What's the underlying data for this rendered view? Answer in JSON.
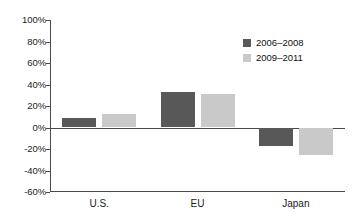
{
  "chart_data": {
    "type": "bar",
    "title": "",
    "subtitle": "",
    "xlabel": "",
    "ylabel": "",
    "categories": [
      "U.S.",
      "EU",
      "Japan"
    ],
    "series": [
      {
        "name": "2006–2008",
        "color": "#585858",
        "values": [
          9,
          33,
          -17
        ]
      },
      {
        "name": "2009–2011",
        "color": "#c9c9c9",
        "values": [
          13,
          31,
          -26
        ]
      }
    ],
    "ylim": [
      -60,
      100
    ],
    "ytick_step": 20,
    "ytick_labels": [
      "100%",
      "80%",
      "60%",
      "40%",
      "20%",
      "0%",
      "-20%",
      "-40%",
      "-60%"
    ],
    "ytick_values": [
      100,
      80,
      60,
      40,
      20,
      0,
      -20,
      -40,
      -60
    ],
    "grid": false,
    "legend_position": "top-right-inside",
    "zero_line": true,
    "value_format": "percent"
  },
  "axes": {
    "y_labels": [
      "100%",
      "80%",
      "60%",
      "40%",
      "20%",
      "0%",
      "-20%",
      "-40%",
      "-60%"
    ],
    "x_labels": [
      "U.S.",
      "EU",
      "Japan"
    ]
  },
  "legend": {
    "items": [
      {
        "label": "2006–2008",
        "color": "#585858"
      },
      {
        "label": "2009–2011",
        "color": "#c9c9c9"
      }
    ]
  },
  "colors": {
    "series_dark": "#585858",
    "series_light": "#c9c9c9",
    "axis": "#4a4a4a",
    "text": "#1a1a1a",
    "background": "#ffffff"
  }
}
